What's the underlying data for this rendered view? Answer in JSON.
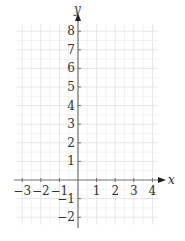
{
  "chart_data": {
    "type": "line",
    "title": "",
    "xlabel": "x",
    "ylabel": "y",
    "xlim": [
      -3.3,
      4.3
    ],
    "ylim": [
      -2.4,
      8.4
    ],
    "x_ticks": [
      -3,
      -2,
      -1,
      1,
      2,
      3,
      4
    ],
    "x_tick_labels": [
      "−3",
      "−2",
      "−1",
      "1",
      "2",
      "3",
      "4"
    ],
    "y_ticks": [
      -2,
      -1,
      1,
      2,
      3,
      4,
      5,
      6,
      7,
      8
    ],
    "y_tick_labels": [
      "−2",
      "−1",
      "1",
      "2",
      "3",
      "4",
      "5",
      "6",
      "7",
      "8"
    ],
    "grid": true,
    "minor_grid": true,
    "series": [],
    "colors": {
      "axis": "#707070",
      "grid_major": "#e6e6e6",
      "grid_minor": "#f2f2f2",
      "text": "#333333"
    }
  }
}
